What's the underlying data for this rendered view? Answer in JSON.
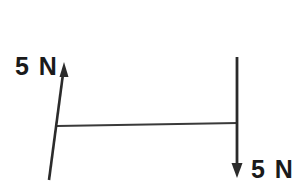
{
  "figure": {
    "background_color": "#ffffff",
    "stroke_color": "#2b2b2b",
    "text_color": "#1a1a1a",
    "labels": {
      "left_force": "5 N",
      "right_force": "5 N"
    },
    "elements": {
      "bar": {
        "name": "horizontal-bar",
        "x1": 57,
        "y1": 126,
        "x2": 238,
        "y2": 123,
        "stroke_width": 2
      },
      "left_arrow": {
        "name": "left-force-arrow",
        "direction": "up",
        "magnitude": "5 N",
        "tail_x": 49,
        "tail_y": 180,
        "tip_x": 64,
        "tip_y": 62,
        "stroke_width": 2.6
      },
      "right_arrow": {
        "name": "right-force-arrow",
        "direction": "down",
        "magnitude": "5 N",
        "tail_x": 237,
        "tail_y": 57,
        "tip_x": 237,
        "tip_y": 178,
        "stroke_width": 2.8
      }
    }
  }
}
